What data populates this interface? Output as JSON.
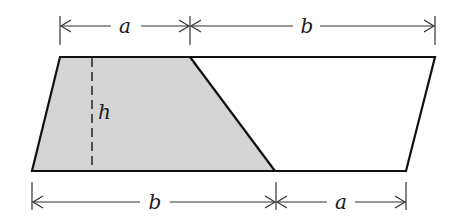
{
  "diagram": {
    "colors": {
      "stroke": "#111111",
      "shaded_fill": "#d4d4d4",
      "unshaded_fill": "#ffffff",
      "dimension": "#333333"
    },
    "labels": {
      "top_left_segment": "a",
      "top_right_segment": "b",
      "height": "h",
      "bottom_left_segment": "b",
      "bottom_right_segment": "a"
    }
  }
}
